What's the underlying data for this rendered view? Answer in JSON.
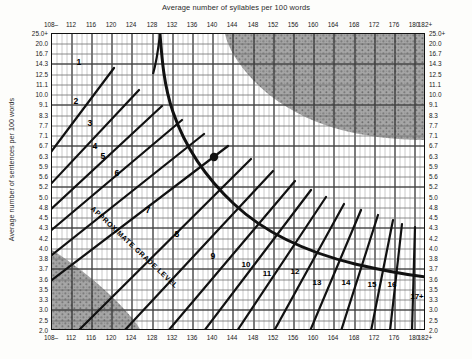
{
  "titles": {
    "top": "Average number of syllables per 100 words",
    "left": "Average number of sentences per 100 words",
    "inner_annotation": "APPROXIMATE GRADE LEVEL"
  },
  "colors": {
    "ink": "#111111",
    "grid_minor": "#9a9a9a",
    "grid_major": "#333333",
    "shade": "#9d9d9d",
    "paper": "#ffffff",
    "page": "#fdfdfb"
  },
  "chart_data": {
    "type": "line",
    "xlabel": "Average number of syllables per 100 words",
    "ylabel": "Average number of sentences per 100 words",
    "grid": true,
    "legend": "none",
    "xlim": [
      108,
      182
    ],
    "ylim": [
      2.0,
      25.0
    ],
    "x_ticks": [
      "108–",
      "112",
      "116",
      "120",
      "124",
      "128",
      "132",
      "136",
      "140",
      "144",
      "148",
      "152",
      "156",
      "160",
      "164",
      "168",
      "172",
      "176",
      "180",
      "182+"
    ],
    "x_tick_values": [
      108,
      112,
      116,
      120,
      124,
      128,
      132,
      136,
      140,
      144,
      148,
      152,
      156,
      160,
      164,
      168,
      172,
      176,
      180,
      182
    ],
    "y_ticks": [
      "25.0+",
      "20.0",
      "16.7",
      "14.3",
      "12.5",
      "11.1",
      "10.0",
      "9.1",
      "8.3",
      "7.7",
      "7.1",
      "6.7",
      "6.3",
      "5.9",
      "5.6",
      "5.2",
      "5.0",
      "4.8",
      "4.5",
      "4.3",
      "4.2",
      "4.0",
      "3.8",
      "3.7",
      "3.6",
      "3.5",
      "3.3",
      "3.0",
      "2.5",
      "2.0"
    ],
    "y_tick_values": [
      25.0,
      20.0,
      16.7,
      14.3,
      12.5,
      11.1,
      10.0,
      9.1,
      8.3,
      7.7,
      7.1,
      6.7,
      6.3,
      5.9,
      5.6,
      5.2,
      5.0,
      4.8,
      4.5,
      4.3,
      4.2,
      4.0,
      3.8,
      3.7,
      3.6,
      3.5,
      3.3,
      3.0,
      2.5,
      2.0
    ],
    "axes_mirrored": {
      "top": true,
      "bottom": true,
      "left": true,
      "right": true
    },
    "grade_labels": [
      "1",
      "2",
      "3",
      "4",
      "5",
      "6",
      "7",
      "8",
      "9",
      "10",
      "11",
      "12",
      "13",
      "14",
      "15",
      "16",
      "17+"
    ],
    "grade_label_positions": [
      {
        "label": "1",
        "x": 78,
        "y": 61
      },
      {
        "label": "2",
        "x": 75,
        "y": 100
      },
      {
        "label": "3",
        "x": 89,
        "y": 122
      },
      {
        "label": "4",
        "x": 94,
        "y": 145
      },
      {
        "label": "5",
        "x": 102,
        "y": 155
      },
      {
        "label": "6",
        "x": 116,
        "y": 172
      },
      {
        "label": "7",
        "x": 147,
        "y": 209
      },
      {
        "label": "8",
        "x": 176,
        "y": 233
      },
      {
        "label": "9",
        "x": 212,
        "y": 255
      },
      {
        "label": "10",
        "x": 245,
        "y": 263
      },
      {
        "label": "11",
        "x": 266,
        "y": 272
      },
      {
        "label": "12",
        "x": 294,
        "y": 270
      },
      {
        "label": "13",
        "x": 316,
        "y": 281
      },
      {
        "label": "14",
        "x": 345,
        "y": 281
      },
      {
        "label": "15",
        "x": 371,
        "y": 283
      },
      {
        "label": "16",
        "x": 391,
        "y": 283
      },
      {
        "label": "17+",
        "x": 416,
        "y": 295
      }
    ],
    "plotted_point": {
      "x_px": 213,
      "y_px": 156,
      "x_value": 140,
      "y_value": 6.3
    },
    "invalid_regions": [
      {
        "name": "upper-right-long-words",
        "note": "shaded: too many syllables, too few sentences"
      },
      {
        "name": "lower-left-short-words",
        "note": "shaded: too few syllables, too many sentences"
      }
    ]
  }
}
